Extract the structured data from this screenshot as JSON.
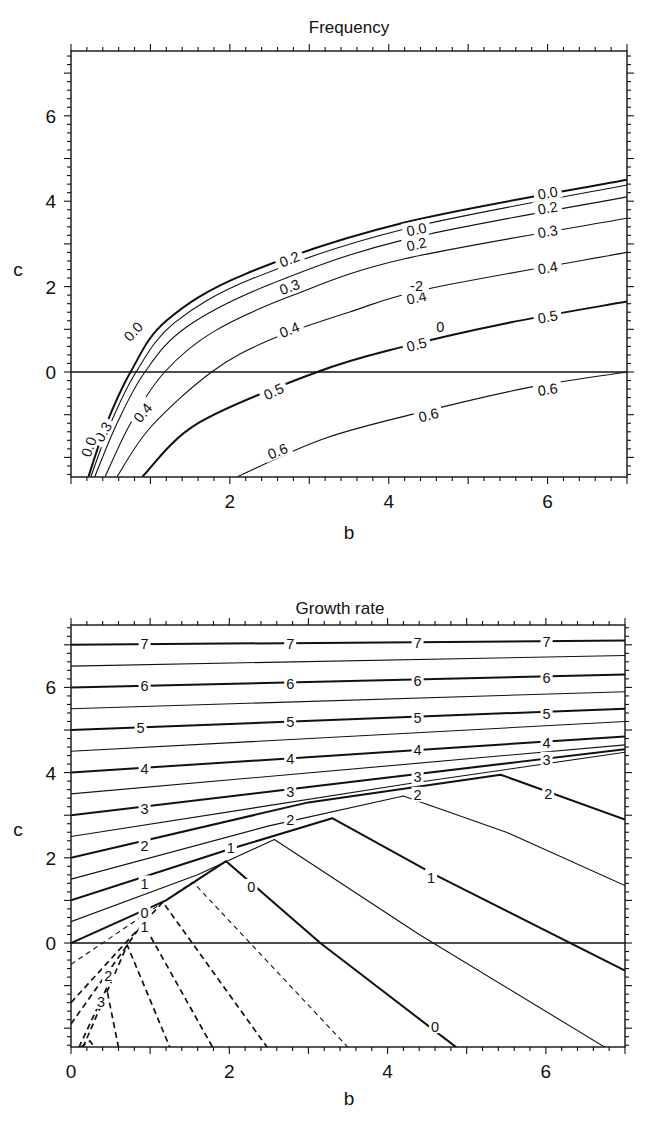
{
  "figure": {
    "panels": [
      "Frequency",
      "Growth rate"
    ]
  },
  "chart_data": [
    {
      "type": "line",
      "subtype": "contour",
      "title": "Frequency",
      "xlabel": "b",
      "ylabel": "c",
      "xlim": [
        0,
        7
      ],
      "ylim": [
        -2.45,
        7.5
      ],
      "xticks": [
        2,
        4,
        6
      ],
      "yticks": [
        0,
        2,
        4,
        6
      ],
      "grid": false,
      "reference_lines": [
        {
          "axis": "y",
          "value": 0
        }
      ],
      "contour_levels": [
        0.0,
        0.1,
        0.2,
        0.3,
        0.4,
        0.5,
        0.6
      ],
      "series": [
        {
          "name": "0.0",
          "style": "thick",
          "points": [
            [
              0.22,
              -2.45
            ],
            [
              0.45,
              -1.2
            ],
            [
              0.75,
              0
            ],
            [
              1.2,
              1.2
            ],
            [
              2.2,
              2.3
            ],
            [
              4.2,
              3.5
            ],
            [
              7,
              4.5
            ]
          ]
        },
        {
          "name": "0.1",
          "style": "thin",
          "points": [
            [
              0.25,
              -2.45
            ],
            [
              0.5,
              -1.2
            ],
            [
              0.82,
              0
            ],
            [
              1.3,
              1.15
            ],
            [
              2.3,
              2.2
            ],
            [
              4.2,
              3.35
            ],
            [
              7,
              4.38
            ]
          ]
        },
        {
          "name": "0.2",
          "style": "thin",
          "points": [
            [
              0.3,
              -2.45
            ],
            [
              0.58,
              -1.2
            ],
            [
              0.93,
              0
            ],
            [
              1.45,
              1.05
            ],
            [
              2.5,
              2.05
            ],
            [
              4.2,
              3.1
            ],
            [
              7,
              4.1
            ]
          ]
        },
        {
          "name": "0.3",
          "style": "thin",
          "points": [
            [
              0.43,
              -2.45
            ],
            [
              0.75,
              -1.2
            ],
            [
              1.18,
              0
            ],
            [
              1.8,
              0.95
            ],
            [
              2.8,
              1.8
            ],
            [
              4.2,
              2.65
            ],
            [
              7,
              3.6
            ]
          ]
        },
        {
          "name": "0.4",
          "style": "thin",
          "points": [
            [
              0.58,
              -2.45
            ],
            [
              1.0,
              -1.3
            ],
            [
              1.77,
              0
            ],
            [
              2.5,
              0.75
            ],
            [
              3.5,
              1.4
            ],
            [
              4.5,
              1.95
            ],
            [
              7,
              2.8
            ]
          ]
        },
        {
          "name": "0.5",
          "style": "thick",
          "points": [
            [
              0.9,
              -2.45
            ],
            [
              1.6,
              -1.2
            ],
            [
              3.1,
              0
            ],
            [
              4.2,
              0.6
            ],
            [
              5.5,
              1.15
            ],
            [
              7,
              1.65
            ]
          ]
        },
        {
          "name": "0.6",
          "style": "thin",
          "points": [
            [
              2.1,
              -2.45
            ],
            [
              3.2,
              -1.55
            ],
            [
              4.5,
              -0.9
            ],
            [
              5.8,
              -0.35
            ],
            [
              7,
              0.0
            ]
          ]
        }
      ],
      "labels": [
        {
          "text": "0.0",
          "b": 0.78,
          "c": 0.95,
          "angle": -48
        },
        {
          "text": "0.0",
          "b": 4.35,
          "c": 3.35,
          "angle": -12
        },
        {
          "text": "0.0",
          "b": 6.0,
          "c": 4.2,
          "angle": -10
        },
        {
          "text": "0.2",
          "b": 4.35,
          "c": 3.0,
          "angle": -12
        },
        {
          "text": "0.2",
          "b": 6.0,
          "c": 3.85,
          "angle": -10
        },
        {
          "text": "0.2",
          "b": 2.75,
          "c": 2.65,
          "angle": -22
        },
        {
          "text": "0.3",
          "b": 2.75,
          "c": 2.0,
          "angle": -20
        },
        {
          "text": "0.3",
          "b": 6.0,
          "c": 3.3,
          "angle": -10
        },
        {
          "text": "0.4",
          "b": 2.75,
          "c": 1.0,
          "angle": -22
        },
        {
          "text": "0.4",
          "b": 6.0,
          "c": 2.45,
          "angle": -10
        },
        {
          "text": "0.4",
          "b": 4.35,
          "c": 1.75,
          "angle": -12
        },
        {
          "text": "0.4",
          "b": 0.9,
          "c": -0.95,
          "angle": -50
        },
        {
          "text": "0.3",
          "b": 0.4,
          "c": -1.4,
          "angle": -60
        },
        {
          "text": "0.0",
          "b": 0.22,
          "c": -1.75,
          "angle": -70
        },
        {
          "text": "0.5",
          "b": 2.55,
          "c": -0.45,
          "angle": -25
        },
        {
          "text": "0.5",
          "b": 4.35,
          "c": 0.65,
          "angle": -14
        },
        {
          "text": "0.5",
          "b": 6.0,
          "c": 1.3,
          "angle": -10
        },
        {
          "text": "0.6",
          "b": 2.6,
          "c": -1.85,
          "angle": -22
        },
        {
          "text": "0.6",
          "b": 4.5,
          "c": -1.0,
          "angle": -14
        },
        {
          "text": "0.6",
          "b": 6.0,
          "c": -0.4,
          "angle": -8
        },
        {
          "text": "-2",
          "b": 4.35,
          "c": 2.02,
          "angle": 0
        },
        {
          "text": "0",
          "b": 4.65,
          "c": 1.07,
          "angle": 0
        }
      ]
    },
    {
      "type": "line",
      "subtype": "contour",
      "title": "Growth rate",
      "xlabel": "b",
      "ylabel": "c",
      "xlim": [
        0,
        7
      ],
      "ylim": [
        -2.45,
        7.5
      ],
      "xticks": [
        0,
        2,
        4,
        6
      ],
      "yticks": [
        0,
        2,
        4,
        6
      ],
      "grid": false,
      "reference_lines": [
        {
          "axis": "y",
          "value": 0
        }
      ],
      "contour_levels": [
        -3,
        -2.5,
        -2,
        -1.5,
        -1,
        -0.5,
        0,
        0.5,
        1,
        1.5,
        2,
        2.5,
        3,
        3.5,
        4,
        4.5,
        5,
        5.5,
        6,
        6.5,
        7
      ],
      "series": [
        {
          "name": "7",
          "style": "thick",
          "points": [
            [
              0,
              7.0
            ],
            [
              7,
              7.1
            ]
          ]
        },
        {
          "name": "6.5",
          "style": "thin",
          "points": [
            [
              0,
              6.5
            ],
            [
              7,
              6.75
            ]
          ]
        },
        {
          "name": "6",
          "style": "thick",
          "points": [
            [
              0,
              6.0
            ],
            [
              7,
              6.3
            ]
          ]
        },
        {
          "name": "5.5",
          "style": "thin",
          "points": [
            [
              0,
              5.5
            ],
            [
              7,
              5.9
            ]
          ]
        },
        {
          "name": "5",
          "style": "thick",
          "points": [
            [
              0,
              5.0
            ],
            [
              7,
              5.5
            ]
          ]
        },
        {
          "name": "4.5",
          "style": "thin",
          "points": [
            [
              0,
              4.5
            ],
            [
              7,
              5.2
            ]
          ]
        },
        {
          "name": "4",
          "style": "thick",
          "points": [
            [
              0,
              4.0
            ],
            [
              7,
              4.85
            ]
          ]
        },
        {
          "name": "3.5",
          "style": "thin",
          "points": [
            [
              0,
              3.5
            ],
            [
              7,
              4.65
            ]
          ]
        },
        {
          "name": "3",
          "style": "thick",
          "points": [
            [
              0,
              3.0
            ],
            [
              7,
              4.55
            ]
          ]
        },
        {
          "name": "2.5",
          "style": "thin",
          "points": [
            [
              0,
              2.5
            ],
            [
              4.3,
              3.75
            ],
            [
              7,
              4.48
            ]
          ]
        },
        {
          "name": "2",
          "style": "thick",
          "points": [
            [
              0,
              2.0
            ],
            [
              3.0,
              3.3
            ],
            [
              5.43,
              3.95
            ],
            [
              7,
              2.9
            ]
          ]
        },
        {
          "name": "1.5",
          "style": "thin",
          "points": [
            [
              0,
              1.5
            ],
            [
              2.5,
              2.75
            ],
            [
              4.2,
              3.45
            ],
            [
              5.5,
              2.6
            ],
            [
              7,
              1.35
            ]
          ]
        },
        {
          "name": "1",
          "style": "thick",
          "points": [
            [
              0,
              1.0
            ],
            [
              2.0,
              2.2
            ],
            [
              3.3,
              2.93
            ],
            [
              4.6,
              1.6
            ],
            [
              7,
              -0.65
            ]
          ]
        },
        {
          "name": "0.5",
          "style": "thin",
          "points": [
            [
              0,
              0.5
            ],
            [
              1.6,
              1.6
            ],
            [
              2.57,
              2.43
            ],
            [
              4.4,
              0.2
            ],
            [
              6.75,
              -2.45
            ]
          ]
        },
        {
          "name": "0",
          "style": "thick",
          "points": [
            [
              0,
              0.0
            ],
            [
              1.2,
              1.0
            ],
            [
              1.96,
              1.92
            ],
            [
              3.15,
              0.0
            ],
            [
              4.87,
              -2.45
            ]
          ]
        },
        {
          "name": "-0.5",
          "style": "dashed-thin",
          "points": [
            [
              0,
              -0.5
            ],
            [
              1.54,
              1.43
            ],
            [
              3.5,
              -2.45
            ]
          ]
        },
        {
          "name": "-1",
          "style": "dashed",
          "points": [
            [
              0,
              -1.4
            ],
            [
              1.16,
              0.96
            ],
            [
              2.48,
              -2.45
            ]
          ]
        },
        {
          "name": "-1.5",
          "style": "dashed",
          "points": [
            [
              0,
              -1.9
            ],
            [
              0.91,
              0.47
            ],
            [
              1.79,
              -2.45
            ]
          ]
        },
        {
          "name": "-2",
          "style": "dashed",
          "points": [
            [
              0.15,
              -2.45
            ],
            [
              0.71,
              -0.05
            ],
            [
              1.25,
              -2.45
            ]
          ]
        },
        {
          "name": "-2.5",
          "style": "dashed",
          "points": [
            [
              0.1,
              -2.45
            ],
            [
              0.45,
              -1.06
            ],
            [
              0.6,
              -2.45
            ]
          ]
        },
        {
          "name": "-3",
          "style": "dashed",
          "points": [
            [
              0.12,
              -2.45
            ],
            [
              0.24,
              -2.3
            ],
            [
              0.3,
              -2.45
            ]
          ]
        }
      ],
      "labels": [
        {
          "text": "7",
          "b": 0.93,
          "c": 7.02
        },
        {
          "text": "7",
          "b": 2.77,
          "c": 7.04
        },
        {
          "text": "7",
          "b": 4.38,
          "c": 7.06
        },
        {
          "text": "7",
          "b": 6.01,
          "c": 7.08
        },
        {
          "text": "6",
          "b": 0.93,
          "c": 6.04
        },
        {
          "text": "6",
          "b": 2.77,
          "c": 6.1
        },
        {
          "text": "6",
          "b": 4.38,
          "c": 6.17
        },
        {
          "text": "6",
          "b": 6.01,
          "c": 6.24
        },
        {
          "text": "5",
          "b": 0.88,
          "c": 5.05
        },
        {
          "text": "5",
          "b": 2.77,
          "c": 5.2
        },
        {
          "text": "5",
          "b": 4.38,
          "c": 5.3
        },
        {
          "text": "5",
          "b": 6.01,
          "c": 5.4
        },
        {
          "text": "4",
          "b": 0.93,
          "c": 4.1
        },
        {
          "text": "4",
          "b": 2.77,
          "c": 4.33
        },
        {
          "text": "4",
          "b": 4.38,
          "c": 4.55
        },
        {
          "text": "4",
          "b": 6.01,
          "c": 4.7
        },
        {
          "text": "3",
          "b": 0.93,
          "c": 3.17
        },
        {
          "text": "3",
          "b": 2.77,
          "c": 3.55
        },
        {
          "text": "3",
          "b": 4.38,
          "c": 3.9
        },
        {
          "text": "3",
          "b": 6.01,
          "c": 4.3
        },
        {
          "text": "2",
          "b": 0.93,
          "c": 2.28
        },
        {
          "text": "2",
          "b": 2.77,
          "c": 2.9
        },
        {
          "text": "2",
          "b": 4.38,
          "c": 3.48
        },
        {
          "text": "2",
          "b": 6.03,
          "c": 3.5
        },
        {
          "text": "1",
          "b": 0.93,
          "c": 1.4
        },
        {
          "text": "1",
          "b": 2.02,
          "c": 2.25
        },
        {
          "text": "1",
          "b": 4.55,
          "c": 1.55
        },
        {
          "text": "0",
          "b": 0.93,
          "c": 0.72
        },
        {
          "text": "0",
          "b": 2.28,
          "c": 1.32
        },
        {
          "text": "0",
          "b": 4.6,
          "c": -1.95
        },
        {
          "text": "1",
          "b": 0.93,
          "c": 0.38
        },
        {
          "text": "2",
          "b": 0.47,
          "c": -0.75
        },
        {
          "text": "3",
          "b": 0.38,
          "c": -1.38
        }
      ]
    }
  ]
}
